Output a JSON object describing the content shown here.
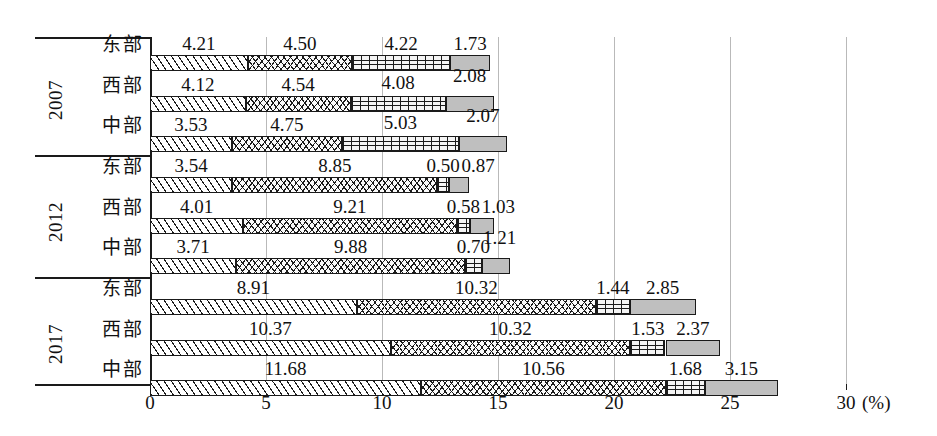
{
  "chart_data": {
    "type": "bar",
    "subtype": "horizontal-stacked",
    "title": "",
    "xlabel": "(%)",
    "ylabel": "",
    "xlim": [
      0,
      30
    ],
    "xticks": [
      0,
      5,
      10,
      15,
      20,
      25,
      30
    ],
    "xtick_labels": [
      "0",
      "5",
      "10",
      "15",
      "20",
      "25",
      "30"
    ],
    "grid": "vertical",
    "legend": "none",
    "unit": "(%)",
    "group_labels": [
      "2007",
      "2012",
      "2017"
    ],
    "categories": [
      "东部",
      "西部",
      "中部"
    ],
    "series": [
      {
        "name": "segment-1",
        "pattern": "diagonal-hatch"
      },
      {
        "name": "segment-2",
        "pattern": "cross-hatch"
      },
      {
        "name": "segment-3",
        "pattern": "brick"
      },
      {
        "name": "segment-4",
        "pattern": "solid-gray"
      }
    ],
    "groups": [
      {
        "year": "2007",
        "rows": [
          {
            "region": "东部",
            "values": [
              4.21,
              4.5,
              4.22,
              1.73
            ],
            "labels": [
              "4.21",
              "4.50",
              "4.22",
              "1.73"
            ],
            "total": 14.66
          },
          {
            "region": "西部",
            "values": [
              4.12,
              4.54,
              4.08,
              2.08
            ],
            "labels": [
              "4.12",
              "4.54",
              "4.08",
              "2.08"
            ],
            "total": 14.82
          },
          {
            "region": "中部",
            "values": [
              3.53,
              4.75,
              5.03,
              2.07
            ],
            "labels": [
              "3.53",
              "4.75",
              "5.03",
              "2.07"
            ],
            "total": 15.38
          }
        ]
      },
      {
        "year": "2012",
        "rows": [
          {
            "region": "东部",
            "values": [
              3.54,
              8.85,
              0.5,
              0.87
            ],
            "labels": [
              "3.54",
              "8.85",
              "0.50",
              "0.87"
            ],
            "total": 13.76
          },
          {
            "region": "西部",
            "values": [
              4.01,
              9.21,
              0.58,
              1.03
            ],
            "labels": [
              "4.01",
              "9.21",
              "0.58",
              "1.03"
            ],
            "total": 14.83
          },
          {
            "region": "中部",
            "values": [
              3.71,
              9.88,
              0.7,
              1.21
            ],
            "labels": [
              "3.71",
              "9.88",
              "0.70",
              "1.21"
            ],
            "total": 15.5
          }
        ]
      },
      {
        "year": "2017",
        "rows": [
          {
            "region": "东部",
            "values": [
              8.91,
              10.32,
              1.44,
              2.85
            ],
            "labels": [
              "8.91",
              "10.32",
              "1.44",
              "2.85"
            ],
            "total": 23.52
          },
          {
            "region": "西部",
            "values": [
              10.37,
              10.32,
              1.53,
              2.37
            ],
            "labels": [
              "10.37",
              "10.32",
              "1.53",
              "2.37"
            ],
            "total": 24.59
          },
          {
            "region": "中部",
            "values": [
              11.68,
              10.56,
              1.68,
              3.15
            ],
            "labels": [
              "11.68",
              "10.56",
              "1.68",
              "3.15"
            ],
            "total": 27.07
          }
        ]
      }
    ]
  },
  "axis": {
    "unit_label": "(%)",
    "ticks": [
      "0",
      "5",
      "10",
      "15",
      "20",
      "25",
      "30"
    ]
  },
  "label_overrides": {
    "g1r0": [
      null,
      null,
      null,
      null
    ],
    "g1r1": [
      null,
      null,
      {
        "dy": -2
      },
      {
        "dy": -9
      }
    ],
    "g1r2": [
      null,
      null,
      {
        "dy": -2
      },
      {
        "dy": -9
      }
    ],
    "g2r2": [
      null,
      null,
      null,
      {
        "dx": 4,
        "dy": -9
      }
    ]
  }
}
